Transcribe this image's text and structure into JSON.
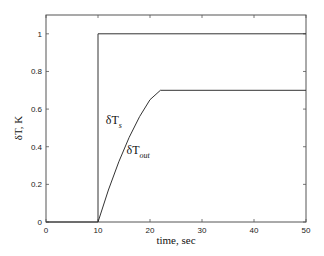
{
  "chart_data": {
    "type": "line",
    "title": "",
    "xlabel": "time, sec",
    "ylabel": "δT, K",
    "xlim": [
      0,
      50
    ],
    "ylim": [
      0,
      1.1
    ],
    "grid": false,
    "legend": "none (inline labels)",
    "xticks": [
      0,
      10,
      20,
      30,
      40,
      50
    ],
    "yticks": [
      0,
      0.2,
      0.4,
      0.6,
      0.8,
      1
    ],
    "xtick_labels": [
      "0",
      "10",
      "20",
      "30",
      "40",
      "50"
    ],
    "ytick_labels": [
      "0",
      "0.2",
      "0.4",
      "0.6",
      "0.8",
      "1"
    ],
    "series": [
      {
        "name": "δT_s",
        "label_main": "δT",
        "label_sub": "s",
        "x": [
          0,
          10,
          10,
          50
        ],
        "y": [
          0,
          0,
          1.0,
          1.0
        ]
      },
      {
        "name": "δT_out",
        "label_main": "δT",
        "label_sub": "out",
        "x": [
          10,
          12,
          14,
          16,
          18,
          20,
          22,
          50
        ],
        "y": [
          0,
          0.17,
          0.32,
          0.45,
          0.56,
          0.65,
          0.7,
          0.7
        ]
      }
    ],
    "annotations": [
      {
        "text": "δT_s",
        "x": 11.5,
        "y": 0.52
      },
      {
        "text": "δT_out",
        "x": 15.5,
        "y": 0.36
      }
    ]
  }
}
